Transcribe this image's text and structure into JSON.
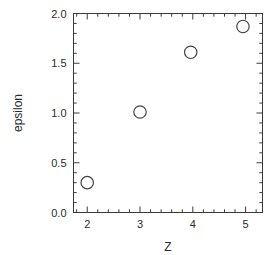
{
  "chart_data": {
    "type": "scatter",
    "title": "",
    "xlabel": "Z",
    "ylabel": "epsilon",
    "xlim": [
      1.74,
      5.32
    ],
    "ylim": [
      0.0,
      2.0
    ],
    "xticks": [
      2,
      3,
      4,
      5
    ],
    "xtick_labels": [
      "2",
      "3",
      "4",
      "5"
    ],
    "yticks": [
      0.0,
      0.5,
      1.0,
      1.5,
      2.0
    ],
    "ytick_labels": [
      "0.0",
      "0.5",
      "1.0",
      "1.5",
      "2.0"
    ],
    "x_minor_tick_interval": 0.2,
    "y_minor_tick_interval": 0.1,
    "grid": false,
    "legend": false,
    "marker": "open-circle",
    "marker_color": "#444444",
    "frame_color": "#3a3a3a",
    "points": [
      {
        "x": 2.0,
        "y": 0.3
      },
      {
        "x": 3.0,
        "y": 1.01
      },
      {
        "x": 3.96,
        "y": 1.61
      },
      {
        "x": 4.95,
        "y": 1.87
      }
    ],
    "x": [
      2.0,
      3.0,
      3.96,
      4.95
    ],
    "values": [
      0.3,
      1.01,
      1.61,
      1.87
    ]
  }
}
